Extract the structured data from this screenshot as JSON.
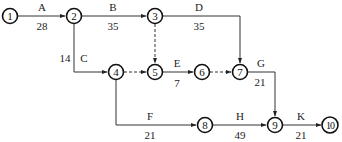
{
  "diagram": {
    "type": "activity-on-arrow network",
    "nodes": [
      {
        "id": "1",
        "label": "1",
        "x": 10,
        "y": 16
      },
      {
        "id": "2",
        "label": "2",
        "x": 74,
        "y": 16
      },
      {
        "id": "3",
        "label": "3",
        "x": 155,
        "y": 16
      },
      {
        "id": "4",
        "label": "4",
        "x": 116,
        "y": 72
      },
      {
        "id": "5",
        "label": "5",
        "x": 155,
        "y": 72
      },
      {
        "id": "6",
        "label": "6",
        "x": 202,
        "y": 72
      },
      {
        "id": "7",
        "label": "7",
        "x": 240,
        "y": 72
      },
      {
        "id": "8",
        "label": "8",
        "x": 205,
        "y": 125
      },
      {
        "id": "9",
        "label": "9",
        "x": 275,
        "y": 125
      },
      {
        "id": "10",
        "label": "10",
        "x": 330,
        "y": 125
      }
    ],
    "activities": [
      {
        "name": "A",
        "duration": "28",
        "from": "1",
        "to": "2",
        "dummy": false
      },
      {
        "name": "B",
        "duration": "35",
        "from": "2",
        "to": "3",
        "dummy": false
      },
      {
        "name": "C",
        "duration": "14",
        "from": "2",
        "to": "4",
        "dummy": false
      },
      {
        "name": "D",
        "duration": "35",
        "from": "3",
        "to": "7",
        "dummy": false
      },
      {
        "name": "E",
        "duration": "7",
        "from": "5",
        "to": "6",
        "dummy": false
      },
      {
        "name": "F",
        "duration": "21",
        "from": "4",
        "to": "8",
        "dummy": false
      },
      {
        "name": "G",
        "duration": "21",
        "from": "7",
        "to": "9",
        "dummy": false
      },
      {
        "name": "H",
        "duration": "49",
        "from": "8",
        "to": "9",
        "dummy": false
      },
      {
        "name": "K",
        "duration": "21",
        "from": "9",
        "to": "10",
        "dummy": false
      },
      {
        "name": "",
        "duration": "",
        "from": "3",
        "to": "5",
        "dummy": true
      },
      {
        "name": "",
        "duration": "",
        "from": "4",
        "to": "5",
        "dummy": true
      },
      {
        "name": "",
        "duration": "",
        "from": "6",
        "to": "7",
        "dummy": true
      }
    ]
  }
}
